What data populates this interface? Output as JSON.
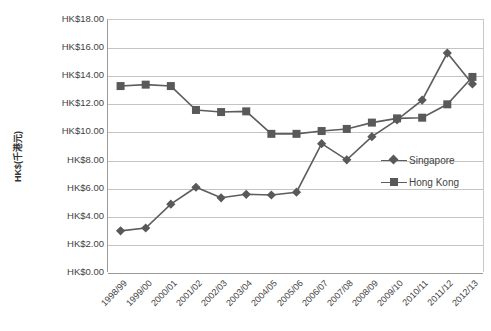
{
  "chart_data": {
    "type": "line",
    "title": "",
    "xlabel": "",
    "ylabel": "HK$(千港元)",
    "ylim": [
      0,
      18
    ],
    "ytick_step": 2,
    "grid": true,
    "legend_position": "right-middle",
    "categories": [
      "1998/99",
      "1999/00",
      "2000/01",
      "2001/02",
      "2002/03",
      "2003/04",
      "2004/05",
      "2005/06",
      "2006/07",
      "2007/08",
      "2008/09",
      "2009/10",
      "2010/11",
      "2011/12",
      "2012/13"
    ],
    "ytick_labels": [
      "HK$18.00",
      "HK$16.00",
      "HK$14.00",
      "HK$12.00",
      "HK$10.00",
      "HK$8.00",
      "HK$6.00",
      "HK$4.00",
      "HK$2.00",
      "HK$0.00"
    ],
    "ytick_values": [
      18,
      16,
      14,
      12,
      10,
      8,
      6,
      4,
      2,
      0
    ],
    "series": [
      {
        "name": "Singapore",
        "marker": "diamond",
        "color": "#595959",
        "values": [
          3.0,
          3.2,
          4.9,
          6.1,
          5.35,
          5.6,
          5.55,
          5.75,
          9.2,
          8.05,
          9.7,
          10.9,
          12.3,
          15.65,
          13.45
        ]
      },
      {
        "name": "Hong Kong",
        "marker": "square",
        "color": "#595959",
        "values": [
          13.3,
          13.4,
          13.3,
          11.6,
          11.45,
          11.5,
          9.9,
          9.9,
          10.1,
          10.25,
          10.7,
          11.0,
          11.05,
          12.0,
          13.95
        ]
      }
    ]
  },
  "legend": {
    "items": [
      {
        "label": "Singapore",
        "marker": "diamond"
      },
      {
        "label": "Hong Kong",
        "marker": "square"
      }
    ]
  },
  "colors": {
    "line": "#5d5d5d",
    "marker": "#595959",
    "grid": "#c4c4c4",
    "axis": "#9a9a9a",
    "text": "#3f3f3f",
    "background": "#ffffff"
  }
}
